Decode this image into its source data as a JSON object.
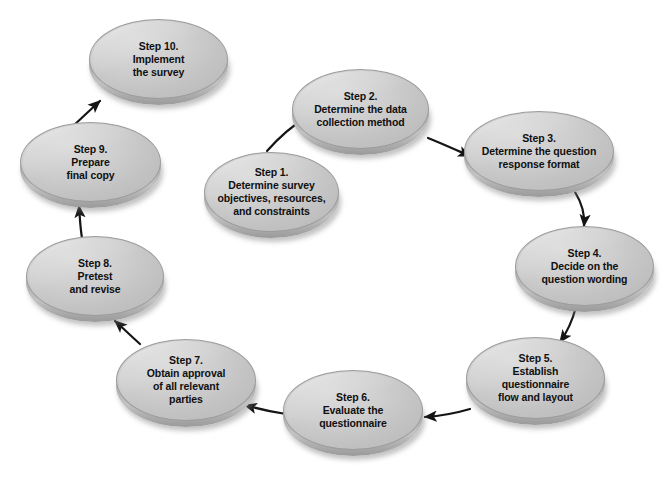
{
  "diagram": {
    "type": "circular-flow",
    "background_color": "#ffffff",
    "node_fill_color": "#cfcfcf",
    "node_rim_color": "#9a9a9a",
    "arrow_color": "#1a1a1a",
    "text_color": "#101010"
  },
  "nodes": [
    {
      "id": "step-1",
      "lines": [
        "Step 1.",
        "Determine survey",
        "objectives, resources,",
        "and constraints"
      ],
      "x": 204,
      "y": 152,
      "w": 135,
      "h": 80
    },
    {
      "id": "step-2",
      "lines": [
        "Step 2.",
        "Determine the data",
        "collection method"
      ],
      "x": 292,
      "y": 69,
      "w": 137,
      "h": 80
    },
    {
      "id": "step-3",
      "lines": [
        "Step 3.",
        "Determine the question",
        "response format"
      ],
      "x": 464,
      "y": 111,
      "w": 150,
      "h": 80
    },
    {
      "id": "step-4",
      "lines": [
        "Step 4.",
        "Decide on the",
        "question wording"
      ],
      "x": 515,
      "y": 226,
      "w": 139,
      "h": 80
    },
    {
      "id": "step-5",
      "lines": [
        "Step 5.",
        "Establish",
        "questionnaire",
        "flow and layout"
      ],
      "x": 466,
      "y": 337,
      "w": 139,
      "h": 82
    },
    {
      "id": "step-6",
      "lines": [
        "Step 6.",
        "Evaluate the",
        "questionnaire"
      ],
      "x": 283,
      "y": 370,
      "w": 140,
      "h": 80
    },
    {
      "id": "step-7",
      "lines": [
        "Step 7.",
        "Obtain approval",
        "of all relevant",
        "parties"
      ],
      "x": 116,
      "y": 339,
      "w": 140,
      "h": 82
    },
    {
      "id": "step-8",
      "lines": [
        "Step 8.",
        "Pretest",
        "and revise"
      ],
      "x": 26,
      "y": 236,
      "w": 138,
      "h": 80
    },
    {
      "id": "step-9",
      "lines": [
        "Step 9.",
        "Prepare",
        "final copy"
      ],
      "x": 20,
      "y": 122,
      "w": 141,
      "h": 80
    },
    {
      "id": "step-10",
      "lines": [
        "Step 10.",
        "Implement",
        "the survey"
      ],
      "x": 89,
      "y": 19,
      "w": 139,
      "h": 80
    }
  ],
  "arrows": [
    {
      "id": "arrow-1-to-2",
      "from": "step-1",
      "to": "step-2",
      "path": "M 267 151 C 280 136 292 126 309 115",
      "style": "curved"
    },
    {
      "id": "arrow-2-to-3",
      "from": "step-2",
      "to": "step-3",
      "path": "M 428 138 C 443 144 456 150 470 156",
      "style": "curved"
    },
    {
      "id": "arrow-3-to-4",
      "from": "step-3",
      "to": "step-4",
      "path": "M 575 192 C 583 205 585 215 584 226",
      "style": "curved"
    },
    {
      "id": "arrow-4-to-5",
      "from": "step-4",
      "to": "step-5",
      "path": "M 576 307 C 572 322 568 331 560 342",
      "style": "curved"
    },
    {
      "id": "arrow-5-to-6",
      "from": "step-5",
      "to": "step-6",
      "path": "M 470 409 C 453 414 440 416 425 417",
      "style": "straight"
    },
    {
      "id": "arrow-6-to-7",
      "from": "step-6",
      "to": "step-7",
      "path": "M 286 414 C 272 412 262 410 245 405",
      "style": "straight"
    },
    {
      "id": "arrow-7-to-8",
      "from": "step-7",
      "to": "step-8",
      "path": "M 140 344 C 131 336 124 329 115 321",
      "style": "straight"
    },
    {
      "id": "arrow-8-to-9",
      "from": "step-8",
      "to": "step-9",
      "path": "M 82 238 C 80 226 80 218 79 206",
      "style": "straight"
    },
    {
      "id": "arrow-9-to-10",
      "from": "step-9",
      "to": "step-10",
      "path": "M 72 127 C 83 117 90 110 100 101",
      "style": "straight"
    },
    {
      "id": "arrow-10-to-1",
      "from": "step-10",
      "to": "step-1",
      "path": "",
      "style": "none"
    }
  ]
}
